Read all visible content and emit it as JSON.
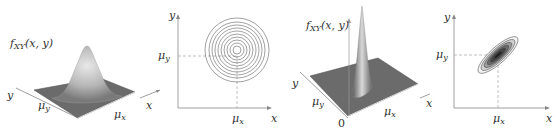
{
  "figure": {
    "panels": [
      {
        "id": "surface-uncorrelated",
        "type": "3d-surface",
        "z_label": "f",
        "z_label_sub": "XY",
        "z_label_args": "(x, y)",
        "axis_y_label": "y",
        "axis_x_label": "x",
        "mu_y_label": "μ",
        "mu_y_sub": "y",
        "mu_x_label": "μ",
        "mu_x_sub": "x"
      },
      {
        "id": "contour-uncorrelated",
        "type": "contour",
        "axis_y_label": "y",
        "axis_x_label": "x",
        "mu_y_label": "μ",
        "mu_y_sub": "y",
        "mu_x_label": "μ",
        "mu_x_sub": "x",
        "contour_shape": "circles",
        "contour_count": 10
      },
      {
        "id": "surface-correlated",
        "type": "3d-surface",
        "z_label": "f",
        "z_label_sub": "XY",
        "z_label_args": "(x, y)",
        "axis_y_label": "y",
        "axis_x_label": "x",
        "mu_y_label": "μ",
        "mu_y_sub": "y",
        "mu_x_label": "μ",
        "mu_x_sub": "x",
        "origin_label": "0"
      },
      {
        "id": "contour-correlated",
        "type": "contour",
        "axis_y_label": "y",
        "axis_x_label": "x",
        "mu_y_label": "μ",
        "mu_y_sub": "y",
        "mu_x_label": "μ",
        "mu_x_sub": "x",
        "contour_shape": "tilted-ellipses",
        "contour_count": 6
      }
    ],
    "colors": {
      "axis": "#777777",
      "contour": "#444444",
      "surface_dark": "#555555",
      "surface_light": "#bbbbbb",
      "dashed": "#999999"
    }
  }
}
